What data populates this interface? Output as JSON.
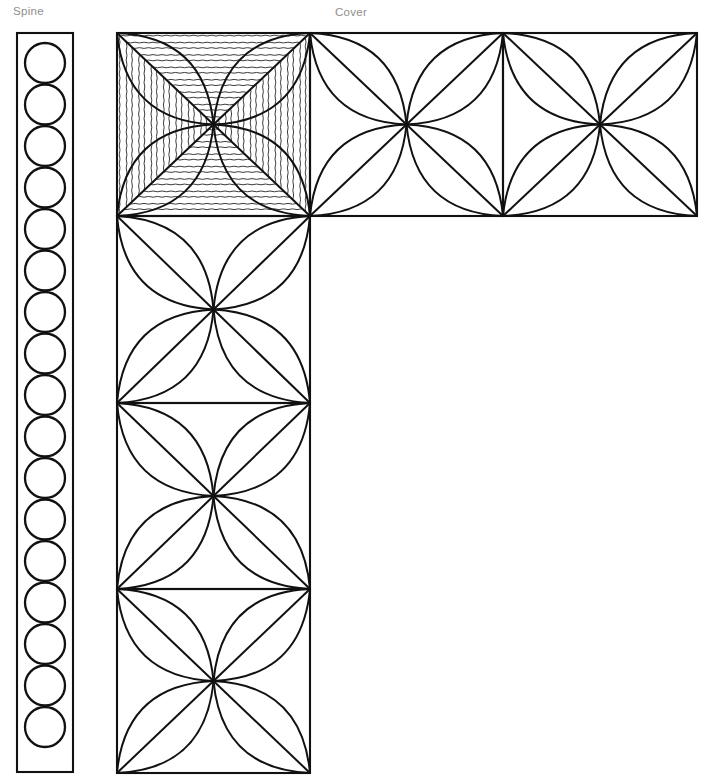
{
  "page": {
    "width": 702,
    "height": 775,
    "background": "#ffffff",
    "ink_color": "#111111",
    "label_color": "#8e8e8e"
  },
  "labels": {
    "spine": "Spine",
    "cover": "Cover"
  },
  "spine": {
    "name": "spine-panel",
    "x": 17,
    "y": 33,
    "width": 56,
    "height": 739,
    "circle_count": 17,
    "circle_radius": 20,
    "circle_first_center_y": 63,
    "circle_spacing": 41.5
  },
  "cover": {
    "name": "cover-panel",
    "cell_width": 193,
    "cell_height": 183,
    "col_x": [
      117,
      310,
      503,
      697
    ],
    "row_y": [
      33,
      216,
      403,
      589,
      773
    ],
    "cells": [
      {
        "id": "cell-r0c0",
        "col": 0,
        "row": 0,
        "motif": "four-petal-rosette",
        "hatching": "wavy",
        "hatch_orientation": "horizontal-top-bottom-vertical-sides"
      },
      {
        "id": "cell-r0c1",
        "col": 1,
        "row": 0,
        "motif": "four-petal-rosette",
        "hatching": "none"
      },
      {
        "id": "cell-r0c2",
        "col": 2,
        "row": 0,
        "motif": "four-petal-rosette",
        "hatching": "none"
      },
      {
        "id": "cell-r1c0",
        "col": 0,
        "row": 1,
        "motif": "four-petal-rosette",
        "hatching": "none"
      },
      {
        "id": "cell-r2c0",
        "col": 0,
        "row": 2,
        "motif": "four-petal-rosette",
        "hatching": "none"
      },
      {
        "id": "cell-r3c0",
        "col": 0,
        "row": 3,
        "motif": "four-petal-rosette",
        "hatching": "none"
      }
    ],
    "petals_per_cell": 4,
    "petal_has_centerline": true,
    "shape": "L-shaped: top row of 3 cells plus left column of 4 cells"
  },
  "chart_data": {
    "type": "diagram",
    "panels": [
      {
        "name": "Spine",
        "kind": "strip",
        "motif": "row of circles",
        "count": 17
      },
      {
        "name": "Cover",
        "kind": "L-shaped tiled grid",
        "motif": "four-petal rosette",
        "tiles": 6,
        "accented_tiles": 1
      }
    ]
  }
}
